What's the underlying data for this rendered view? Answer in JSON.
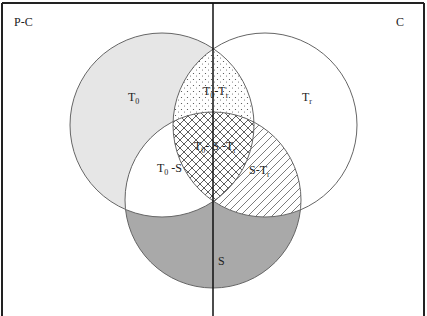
{
  "diagram": {
    "type": "venn",
    "regions": {
      "left_label": "P-C",
      "right_label": "C"
    },
    "sets": [
      {
        "id": "T0",
        "label_main": "T",
        "label_sub": "0",
        "fill": "#e6e6e6"
      },
      {
        "id": "Tr",
        "label_main": "T",
        "label_sub": "r",
        "fill": "#ffffff"
      },
      {
        "id": "S",
        "label_main": "S",
        "label_sub": "",
        "fill": "#a9a9a9"
      }
    ],
    "intersections": {
      "t0_tr": {
        "parts": [
          "T",
          "0",
          "-T",
          "r"
        ],
        "pattern": "dots"
      },
      "t0_s_tr": {
        "parts": [
          "T",
          "0",
          "- S -T",
          "r"
        ],
        "pattern": "crosshatch"
      },
      "t0_s": {
        "parts": [
          "T",
          "0",
          " -S"
        ],
        "pattern": "none"
      },
      "s_tr": {
        "parts": [
          "S-T",
          "r"
        ],
        "pattern": "diagonal-lines"
      }
    },
    "colors": {
      "stroke": "#555555",
      "frame": "#222222",
      "t0_fill": "#e6e6e6",
      "s_fill": "#a9a9a9",
      "hatch": "#333333"
    }
  }
}
